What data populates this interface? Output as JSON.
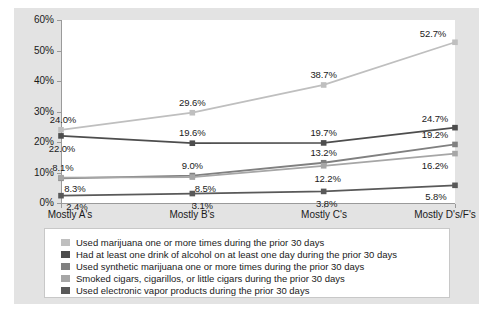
{
  "chart_data": {
    "type": "line",
    "title": "",
    "xlabel": "",
    "ylabel": "",
    "categories": [
      "Mostly A's",
      "Mostly B's",
      "Mostly C's",
      "Mostly D's/F's"
    ],
    "ylim": [
      0,
      60
    ],
    "yticks": [
      "0%",
      "10%",
      "20%",
      "30%",
      "40%",
      "50%",
      "60%"
    ],
    "ytick_values": [
      0,
      10,
      20,
      30,
      40,
      50,
      60
    ],
    "grid": false,
    "legend_position": "bottom",
    "series": [
      {
        "name": "Used marijuana one or more times during the prior 30 days",
        "color": "#bfbfbf",
        "values": [
          24.0,
          29.6,
          38.7,
          52.7
        ],
        "labels": [
          "24.0%",
          "29.6%",
          "38.7%",
          "52.7%"
        ]
      },
      {
        "name": "Had at least one drink of alcohol on at least one day during the prior 30 days",
        "color": "#4d4d4d",
        "values": [
          22.0,
          19.6,
          19.7,
          24.7
        ],
        "labels": [
          "22.0%",
          "19.6%",
          "19.7%",
          "24.7%"
        ]
      },
      {
        "name": "Used synthetic marijuana one or more times during the prior 30 days",
        "color": "#808080",
        "values": [
          8.1,
          9.0,
          13.2,
          19.2
        ],
        "labels": [
          "8.1%",
          "9.0%",
          "13.2%",
          "19.2%"
        ]
      },
      {
        "name": "Smoked cigars, cigarillos, or little cigars during the prior 30 days",
        "color": "#a6a6a6",
        "values": [
          8.3,
          8.5,
          12.2,
          16.2
        ],
        "labels": [
          "8.3%",
          "8.5%",
          "12.2%",
          "16.2%"
        ]
      },
      {
        "name": "Used electronic vapor products during the prior 30 days",
        "color": "#595959",
        "values": [
          2.4,
          3.1,
          3.8,
          5.8
        ],
        "labels": [
          "2.4%",
          "3.1%",
          "3.8%",
          "5.8%"
        ]
      }
    ]
  },
  "legend": {
    "items": [
      {
        "label": "Used marijuana one or more times during the prior 30 days",
        "color": "#bfbfbf"
      },
      {
        "label": "Had at least one drink of alcohol on at least one day during the prior 30 days",
        "color": "#4d4d4d"
      },
      {
        "label": "Used synthetic marijuana one or more times during the prior 30 days",
        "color": "#808080"
      },
      {
        "label": "Smoked cigars, cigarillos, or little cigars during the prior 30 days",
        "color": "#a6a6a6"
      },
      {
        "label": "Used electronic vapor products during the prior 30 days",
        "color": "#595959"
      }
    ]
  },
  "colors": {
    "card_background": "#e3e3e3",
    "panel_background": "#ffffff",
    "axis": "#9a9a9a",
    "text": "#1a1a1a",
    "legend_border": "#c8c8c8"
  }
}
